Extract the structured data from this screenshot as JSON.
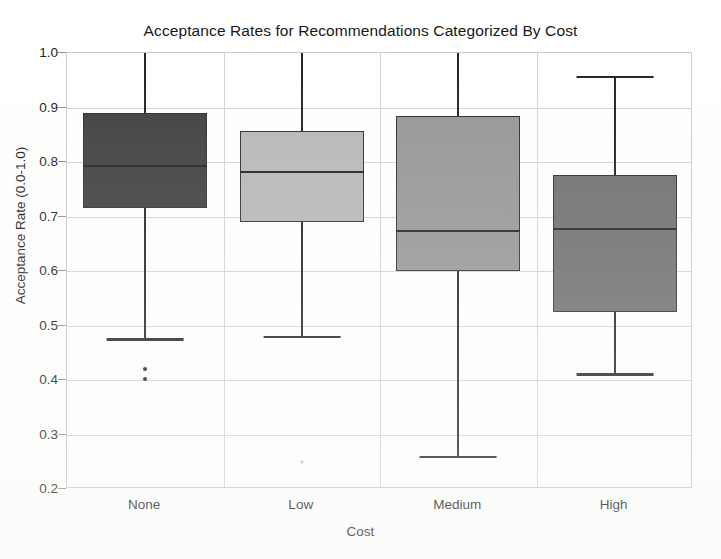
{
  "chart_data": {
    "type": "box",
    "title": "Acceptance Rates for Recommendations Categorized By Cost",
    "xlabel": "Cost",
    "ylabel": "Acceptance Rate (0.0-1.0)",
    "categories": [
      "None",
      "Low",
      "Medium",
      "High"
    ],
    "ylim": [
      0.2,
      1.0
    ],
    "ytick_labels": [
      "1.0",
      "0.9",
      "0.8",
      "0.7",
      "0.6",
      "0.5",
      "0.4",
      "0.3",
      "0.2"
    ],
    "ytick_values": [
      1.0,
      0.9,
      0.8,
      0.7,
      0.6,
      0.5,
      0.4,
      0.3,
      0.2
    ],
    "grid": true,
    "legend": "none",
    "boxes": [
      {
        "category": "None",
        "whisker_low": 0.477,
        "q1": 0.715,
        "median": 0.795,
        "q3": 0.89,
        "whisker_high": 1.0,
        "outliers": [
          0.42,
          0.402
        ],
        "fill_color": "#3b3b3b"
      },
      {
        "category": "Low",
        "whisker_low": 0.481,
        "q1": 0.69,
        "median": 0.783,
        "q3": 0.857,
        "whisker_high": 1.0,
        "outliers": [
          0.25
        ],
        "fill_color": "#b6b6b6"
      },
      {
        "category": "Medium",
        "whisker_low": 0.261,
        "q1": 0.6,
        "median": 0.676,
        "q3": 0.885,
        "whisker_high": 1.0,
        "outliers": [],
        "fill_color": "#949494"
      },
      {
        "category": "High",
        "whisker_low": 0.412,
        "q1": 0.524,
        "median": 0.679,
        "q3": 0.777,
        "whisker_high": 0.958,
        "outliers": [],
        "fill_color": "#6c6c6c"
      }
    ]
  },
  "colors": {
    "axis": "#c9c9c9",
    "grid": "#d2d2d2",
    "ink": "#1e1e1e",
    "background": "#ffffff"
  }
}
